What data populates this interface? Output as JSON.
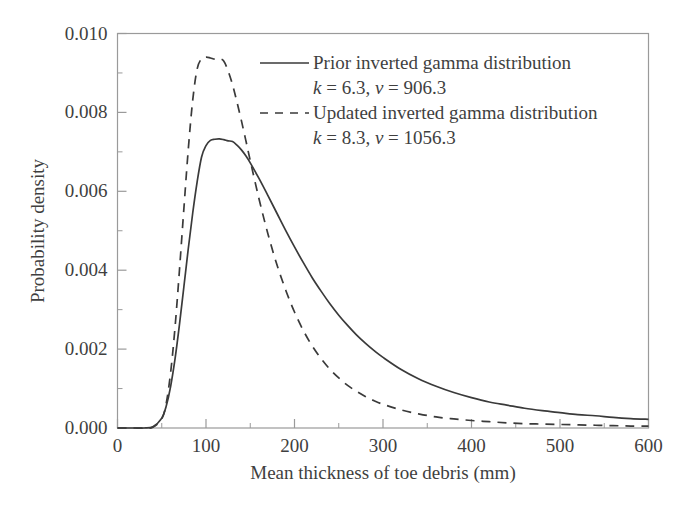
{
  "chart_data": {
    "type": "line",
    "title": "",
    "xlabel": "Mean thickness of toe debris (mm)",
    "ylabel": "Probability density",
    "xlim": [
      0,
      600
    ],
    "ylim": [
      0,
      0.01
    ],
    "xticks": [
      0,
      100,
      200,
      300,
      400,
      500,
      600
    ],
    "xtick_labels": [
      "0",
      "100",
      "200",
      "300",
      "400",
      "500",
      "600"
    ],
    "xminor_ticks": [
      50,
      150,
      250,
      350,
      450,
      550
    ],
    "yticks": [
      0.0,
      0.002,
      0.004,
      0.006,
      0.008,
      0.01
    ],
    "ytick_labels": [
      "0.000",
      "0.002",
      "0.004",
      "0.006",
      "0.008",
      "0.010"
    ],
    "yminor_ticks": [
      0.001,
      0.003,
      0.005,
      0.007,
      0.009
    ],
    "grid": false,
    "legend_position": "top-right",
    "x": [
      0,
      10,
      20,
      30,
      40,
      50,
      55,
      60,
      65,
      70,
      75,
      80,
      85,
      90,
      95,
      100,
      105,
      110,
      115,
      120,
      125,
      130,
      135,
      140,
      145,
      150,
      160,
      170,
      180,
      190,
      200,
      210,
      220,
      230,
      240,
      250,
      260,
      270,
      280,
      290,
      300,
      320,
      340,
      360,
      380,
      400,
      420,
      440,
      460,
      480,
      500,
      520,
      540,
      560,
      580,
      600
    ],
    "series": [
      {
        "name": "Prior inverted gamma distribution",
        "style": "solid",
        "color": "#3a3a3a",
        "params": {
          "k": 6.3,
          "nu": 906.3
        },
        "param_text": "k = 6.3, ν = 906.3",
        "values": [
          0.0,
          0.0,
          0.0,
          0.0,
          3e-05,
          0.00025,
          0.00055,
          0.00105,
          0.00175,
          0.00262,
          0.00358,
          0.00455,
          0.00545,
          0.00624,
          0.00687,
          0.00716,
          0.00729,
          0.00732,
          0.00733,
          0.00731,
          0.00728,
          0.00726,
          0.00717,
          0.00705,
          0.0069,
          0.00672,
          0.00632,
          0.00589,
          0.00545,
          0.00501,
          0.00459,
          0.00419,
          0.00381,
          0.00347,
          0.00315,
          0.00286,
          0.0026,
          0.00236,
          0.00215,
          0.00196,
          0.00179,
          0.00149,
          0.00125,
          0.00106,
          0.0009,
          0.00077,
          0.00066,
          0.00058,
          0.0005,
          0.00044,
          0.00039,
          0.00034,
          0.00031,
          0.00027,
          0.00024,
          0.00022
        ]
      },
      {
        "name": "Updated inverted gamma distribution",
        "style": "dashed",
        "color": "#3a3a3a",
        "params": {
          "k": 8.3,
          "nu": 1056.3
        },
        "param_text": "k = 8.3, ν = 1056.3",
        "values": [
          0.0,
          0.0,
          0.0,
          0.0,
          2e-05,
          0.00023,
          0.00062,
          0.0014,
          0.00255,
          0.004,
          0.00556,
          0.00707,
          0.00831,
          0.0091,
          0.00936,
          0.0094,
          0.00938,
          0.00935,
          0.00936,
          0.0093,
          0.00905,
          0.0087,
          0.00826,
          0.00779,
          0.00729,
          0.00678,
          0.0058,
          0.00492,
          0.00415,
          0.0035,
          0.00294,
          0.00247,
          0.00208,
          0.00176,
          0.00149,
          0.00127,
          0.00108,
          0.00093,
          0.0008,
          0.00069,
          0.0006,
          0.00046,
          0.00036,
          0.00028,
          0.00023,
          0.00019,
          0.00016,
          0.00013,
          0.00011,
          0.0001,
          9e-05,
          8e-05,
          7e-05,
          6e-05,
          5e-05,
          5e-05
        ]
      }
    ]
  },
  "axes": {
    "ylabel": "Probability density",
    "xlabel": "Mean thickness of toe debris (mm)"
  },
  "legend": {
    "entries": [
      {
        "label": "Prior inverted gamma distribution",
        "param_line": "k = 6.3, ν = 906.3",
        "k_symbol": "k",
        "k_value": " = 6.3, ",
        "nu_symbol": "ν",
        "nu_value": " = 906.3",
        "style": "solid"
      },
      {
        "label": "Updated inverted gamma distribution",
        "param_line": "k = 8.3, ν = 1056.3",
        "k_symbol": "k",
        "k_value": " = 8.3, ",
        "nu_symbol": "ν",
        "nu_value": " = 1056.3",
        "style": "dashed"
      }
    ]
  },
  "colors": {
    "line": "#3a3a3a",
    "frame": "#9a9a9a",
    "text": "#3f3f3f",
    "background": "#ffffff"
  }
}
